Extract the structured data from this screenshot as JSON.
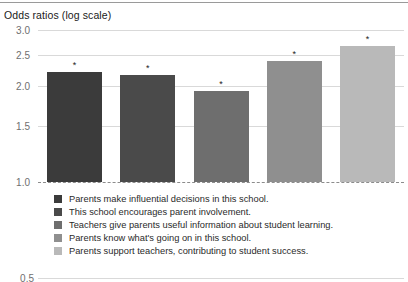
{
  "chart_data": {
    "type": "bar",
    "title": "Odds ratios (log scale)",
    "xlabel": "",
    "ylabel": "",
    "scale": "log",
    "ylim": [
      0.5,
      3.0
    ],
    "yticks": [
      "3.0",
      "2.5",
      "2.0",
      "1.5",
      "1.0",
      "0.5"
    ],
    "ytick_values": [
      3.0,
      2.5,
      2.0,
      1.5,
      1.0,
      0.5
    ],
    "grid": true,
    "legend_position": "below",
    "reference_line": {
      "value": 1.0,
      "style": "dashed"
    },
    "categories": [
      "Parents make influential decisions in this school.",
      "This school encourages parent involvement.",
      "Teachers give parents useful information about student learning.",
      "Parents know what's going on in this school.",
      "Parents support teachers, contributing to student success."
    ],
    "values": [
      2.22,
      2.17,
      1.93,
      2.4,
      2.67
    ],
    "colors": [
      "#3b3b3b",
      "#4a4a4a",
      "#6e6e6e",
      "#8f8f8f",
      "#b9b9b9"
    ],
    "annotations": [
      "*",
      "*",
      "*",
      "*",
      "*"
    ]
  },
  "legend": {
    "items": [
      {
        "label": "Parents make influential decisions in this school.",
        "color": "#3b3b3b"
      },
      {
        "label": "This school encourages parent involvement.",
        "color": "#4a4a4a"
      },
      {
        "label": "Teachers give parents useful information about student learning.",
        "color": "#6e6e6e"
      },
      {
        "label": "Parents know what's going on in this school.",
        "color": "#8f8f8f"
      },
      {
        "label": "Parents support teachers, contributing to student success.",
        "color": "#b9b9b9"
      }
    ]
  }
}
